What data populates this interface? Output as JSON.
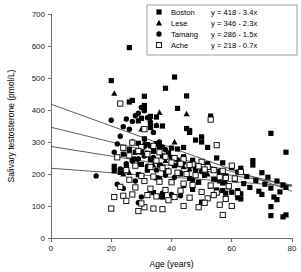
{
  "chart_data": {
    "type": "scatter",
    "title": "",
    "xlabel": "Age (years)",
    "ylabel": "Salivary testosterone (pmol/L)",
    "xlim": [
      0,
      80
    ],
    "ylim": [
      0,
      700
    ],
    "xticks": [
      0,
      20,
      40,
      60,
      80
    ],
    "yticks": [
      0,
      100,
      200,
      300,
      400,
      500,
      600,
      700
    ],
    "grid": false,
    "legend_position": "top-right",
    "series": [
      {
        "name": "Boston",
        "marker": "filled-square",
        "color": "#000000",
        "fit_label": "y = 418 - 3.4x",
        "fit_intercept": 418,
        "fit_slope": -3.4,
        "points": [
          [
            26,
            595
          ],
          [
            20,
            492
          ],
          [
            41,
            503
          ],
          [
            38,
            468
          ],
          [
            45,
            444
          ],
          [
            31,
            443
          ],
          [
            27,
            430
          ],
          [
            26,
            425
          ],
          [
            31,
            414
          ],
          [
            42,
            405
          ],
          [
            31,
            401
          ],
          [
            53,
            381
          ],
          [
            33,
            380
          ],
          [
            35,
            378
          ],
          [
            30,
            374
          ],
          [
            29,
            366
          ],
          [
            37,
            350
          ],
          [
            33,
            345
          ],
          [
            45,
            342
          ],
          [
            46,
            336
          ],
          [
            46,
            330
          ],
          [
            73,
            327
          ],
          [
            50,
            316
          ],
          [
            31,
            310
          ],
          [
            48,
            306
          ],
          [
            50,
            300
          ],
          [
            29,
            296
          ],
          [
            35,
            295
          ],
          [
            32,
            292
          ],
          [
            33,
            288
          ],
          [
            36,
            286
          ],
          [
            44,
            283
          ],
          [
            40,
            281
          ],
          [
            52,
            283
          ],
          [
            42,
            278
          ],
          [
            26,
            276
          ],
          [
            30,
            273
          ],
          [
            34,
            271
          ],
          [
            28,
            268
          ],
          [
            39,
            266
          ],
          [
            78,
            268
          ],
          [
            24,
            262
          ],
          [
            31,
            258
          ],
          [
            37,
            256
          ],
          [
            44,
            254
          ],
          [
            55,
            250
          ],
          [
            27,
            247
          ],
          [
            33,
            245
          ],
          [
            47,
            243
          ],
          [
            67,
            242
          ],
          [
            67,
            228
          ],
          [
            57,
            235
          ],
          [
            52,
            232
          ],
          [
            30,
            230
          ],
          [
            36,
            228
          ],
          [
            41,
            226
          ],
          [
            21,
            224
          ],
          [
            25,
            222
          ],
          [
            60,
            220
          ],
          [
            63,
            218
          ],
          [
            48,
            215
          ],
          [
            32,
            212
          ],
          [
            38,
            210
          ],
          [
            56,
            208
          ],
          [
            62,
            206
          ],
          [
            70,
            204
          ],
          [
            43,
            200
          ],
          [
            29,
            198
          ],
          [
            51,
            196
          ],
          [
            58,
            194
          ],
          [
            65,
            192
          ],
          [
            72,
            190
          ],
          [
            35,
            188
          ],
          [
            46,
            186
          ],
          [
            54,
            184
          ],
          [
            61,
            182
          ],
          [
            68,
            180
          ],
          [
            75,
            178
          ],
          [
            40,
            176
          ],
          [
            49,
            174
          ],
          [
            57,
            172
          ],
          [
            64,
            170
          ],
          [
            71,
            168
          ],
          [
            77,
            166
          ],
          [
            44,
            164
          ],
          [
            53,
            162
          ],
          [
            59,
            160
          ],
          [
            66,
            158
          ],
          [
            73,
            156
          ],
          [
            78,
            158
          ],
          [
            47,
            152
          ],
          [
            55,
            150
          ],
          [
            62,
            148
          ],
          [
            69,
            146
          ],
          [
            76,
            144
          ],
          [
            34,
            142
          ],
          [
            58,
            140
          ],
          [
            63,
            138
          ],
          [
            70,
            136
          ],
          [
            74,
            128
          ],
          [
            62,
            126
          ],
          [
            63,
            122
          ],
          [
            75,
            120
          ],
          [
            73,
            98
          ],
          [
            73,
            70
          ],
          [
            77,
            66
          ],
          [
            78,
            72
          ],
          [
            21,
            210
          ],
          [
            23,
            205
          ],
          [
            36,
            130
          ],
          [
            37,
            128
          ],
          [
            50,
            112
          ],
          [
            57,
            148
          ],
          [
            60,
            143
          ]
        ]
      },
      {
        "name": "Lese",
        "marker": "filled-triangle",
        "color": "#000000",
        "fit_label": "y = 346 - 2.3x",
        "fit_intercept": 346,
        "fit_slope": -2.3,
        "points": [
          [
            21,
            452
          ],
          [
            36,
            392
          ],
          [
            45,
            388
          ],
          [
            33,
            370
          ],
          [
            27,
            302
          ],
          [
            31,
            298
          ],
          [
            35,
            352
          ],
          [
            41,
            300
          ],
          [
            30,
            268
          ],
          [
            38,
            242
          ],
          [
            40,
            238
          ],
          [
            43,
            235
          ],
          [
            29,
            232
          ],
          [
            34,
            228
          ],
          [
            37,
            225
          ],
          [
            44,
            222
          ],
          [
            32,
            218
          ],
          [
            46,
            215
          ],
          [
            28,
            246
          ],
          [
            39,
            212
          ],
          [
            48,
            208
          ],
          [
            26,
            204
          ],
          [
            52,
            200
          ],
          [
            55,
            182
          ],
          [
            56,
            178
          ],
          [
            24,
            200
          ],
          [
            42,
            230
          ],
          [
            50,
            210
          ],
          [
            58,
            175
          ],
          [
            30,
            340
          ]
        ]
      },
      {
        "name": "Tamang",
        "marker": "filled-circle",
        "color": "#000000",
        "fit_label": "y = 286 - 1.5x",
        "fit_intercept": 286,
        "fit_slope": -1.5,
        "points": [
          [
            20,
            368
          ],
          [
            25,
            372
          ],
          [
            30,
            408
          ],
          [
            31,
            398
          ],
          [
            29,
            390
          ],
          [
            28,
            382
          ],
          [
            32,
            376
          ],
          [
            27,
            364
          ],
          [
            33,
            358
          ],
          [
            35,
            352
          ],
          [
            24,
            348
          ],
          [
            26,
            340
          ],
          [
            34,
            330
          ],
          [
            23,
            318
          ],
          [
            36,
            300
          ],
          [
            22,
            294
          ],
          [
            37,
            284
          ],
          [
            38,
            276
          ],
          [
            21,
            268
          ],
          [
            39,
            262
          ],
          [
            31,
            256
          ],
          [
            40,
            252
          ],
          [
            29,
            248
          ],
          [
            42,
            244
          ],
          [
            27,
            240
          ],
          [
            44,
            236
          ],
          [
            25,
            232
          ],
          [
            46,
            228
          ],
          [
            32,
            224
          ],
          [
            48,
            220
          ],
          [
            23,
            216
          ],
          [
            35,
            212
          ],
          [
            50,
            208
          ],
          [
            43,
            204
          ],
          [
            45,
            200
          ],
          [
            38,
            196
          ],
          [
            15,
            194
          ],
          [
            41,
            190
          ],
          [
            36,
            186
          ],
          [
            47,
            182
          ],
          [
            28,
            178
          ],
          [
            22,
            168
          ],
          [
            24,
            155
          ],
          [
            33,
            150
          ],
          [
            30,
            128
          ],
          [
            29,
            110
          ],
          [
            37,
            140
          ],
          [
            40,
            136
          ],
          [
            43,
            132
          ],
          [
            34,
            252
          ],
          [
            26,
            260
          ],
          [
            31,
            286
          ]
        ]
      },
      {
        "name": "Ache",
        "marker": "open-square",
        "color": "#000000",
        "fit_label": "y = 218 - 0.7x",
        "fit_intercept": 218,
        "fit_slope": -0.7,
        "points": [
          [
            23,
            420
          ],
          [
            31,
            340
          ],
          [
            53,
            370
          ],
          [
            55,
            290
          ],
          [
            30,
            284
          ],
          [
            24,
            282
          ],
          [
            27,
            298
          ],
          [
            34,
            288
          ],
          [
            29,
            272
          ],
          [
            36,
            268
          ],
          [
            32,
            262
          ],
          [
            26,
            258
          ],
          [
            38,
            254
          ],
          [
            41,
            250
          ],
          [
            44,
            246
          ],
          [
            47,
            230
          ],
          [
            50,
            238
          ],
          [
            22,
            252
          ],
          [
            35,
            242
          ],
          [
            40,
            236
          ],
          [
            43,
            232
          ],
          [
            46,
            228
          ],
          [
            49,
            224
          ],
          [
            52,
            222
          ],
          [
            28,
            226
          ],
          [
            33,
            222
          ],
          [
            37,
            218
          ],
          [
            51,
            214
          ],
          [
            54,
            212
          ],
          [
            57,
            210
          ],
          [
            60,
            226
          ],
          [
            63,
            206
          ],
          [
            25,
            212
          ],
          [
            39,
            208
          ],
          [
            42,
            204
          ],
          [
            45,
            200
          ],
          [
            48,
            196
          ],
          [
            30,
            194
          ],
          [
            34,
            192
          ],
          [
            56,
            190
          ],
          [
            58,
            188
          ],
          [
            61,
            186
          ],
          [
            26,
            182
          ],
          [
            31,
            178
          ],
          [
            36,
            176
          ],
          [
            40,
            174
          ],
          [
            44,
            170
          ],
          [
            47,
            166
          ],
          [
            53,
            164
          ],
          [
            59,
            162
          ],
          [
            23,
            160
          ],
          [
            28,
            158
          ],
          [
            33,
            154
          ],
          [
            38,
            150
          ],
          [
            43,
            148
          ],
          [
            50,
            144
          ],
          [
            55,
            142
          ],
          [
            62,
            140
          ],
          [
            21,
            128
          ],
          [
            24,
            132
          ],
          [
            27,
            136
          ],
          [
            32,
            134
          ],
          [
            35,
            130
          ],
          [
            41,
            128
          ],
          [
            46,
            126
          ],
          [
            52,
            124
          ],
          [
            58,
            122
          ],
          [
            20,
            92
          ],
          [
            29,
            84
          ],
          [
            31,
            96
          ],
          [
            34,
            92
          ],
          [
            37,
            90
          ],
          [
            44,
            100
          ],
          [
            51,
            110
          ],
          [
            56,
            104
          ],
          [
            57,
            72
          ],
          [
            60,
            100
          ],
          [
            25,
            116
          ],
          [
            30,
            108
          ],
          [
            39,
            118
          ],
          [
            49,
            96
          ],
          [
            54,
            134
          ]
        ]
      }
    ]
  },
  "legend": {
    "entries": [
      {
        "label": "Boston",
        "equation": "y = 418 - 3.4x",
        "marker": "filled-square"
      },
      {
        "label": "Lese",
        "equation": "y = 346 - 2.3x",
        "marker": "filled-triangle"
      },
      {
        "label": "Tamang",
        "equation": "y = 286 - 1.5x",
        "marker": "filled-circle"
      },
      {
        "label": "Ache",
        "equation": "y = 218 - 0.7x",
        "marker": "open-square"
      }
    ]
  },
  "axes": {
    "x_title": "Age (years)",
    "y_title": "Salivary testosterone (pmol/L)",
    "x_tick_labels": [
      "0",
      "20",
      "40",
      "60",
      "80"
    ],
    "y_tick_labels": [
      "0",
      "100",
      "200",
      "300",
      "400",
      "500",
      "600",
      "700"
    ]
  }
}
